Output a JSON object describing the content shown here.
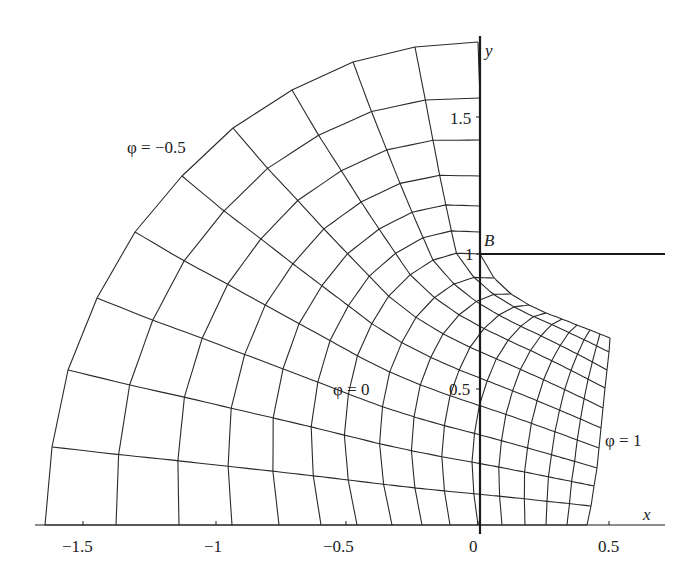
{
  "chart_data": {
    "type": "diagram",
    "title": "",
    "xlabel": "x",
    "ylabel": "y",
    "x_ticks": [
      "−1.5",
      "−1",
      "−0.5",
      "0",
      "0.5"
    ],
    "x_tick_values": [
      -1.5,
      -1,
      -0.5,
      0,
      0.5
    ],
    "y_ticks": [
      "0.5",
      "1",
      "1.5"
    ],
    "y_tick_values": [
      0.5,
      1,
      1.5
    ],
    "xlim": [
      -1.65,
      0.7
    ],
    "ylim": [
      0,
      1.78
    ],
    "point_labels": [
      {
        "text": "B",
        "x": 0,
        "y": 1
      }
    ],
    "curve_labels": [
      {
        "text": "φ = −0.5",
        "position": "outer arc"
      },
      {
        "text": "φ = 0",
        "position": "middle"
      },
      {
        "text": "φ = 1",
        "position": "right boundary"
      }
    ],
    "phi_range": [
      -0.5,
      1.0
    ],
    "phi_step": 0.1,
    "psi_range": [
      0,
      1.0
    ],
    "psi_step": 0.1,
    "grid_on": false,
    "legend": "none"
  },
  "axes": {
    "x_label": "x",
    "y_label": "y",
    "x_ticks": [
      "−1.5",
      "−1",
      "−0.5",
      "0",
      "0.5"
    ],
    "y_ticks": [
      "0.5",
      "1",
      "1.5"
    ],
    "y_tick_1": "1",
    "y_tick_15": "1.5",
    "y_tick_05": "0.5"
  },
  "labels": {
    "point_b": "B",
    "phi_outer": "φ = −0.5",
    "phi_zero": "φ = 0",
    "phi_one": "φ = 1"
  },
  "colors": {
    "line": "#2a2a2a",
    "axis": "#1a1a1a",
    "background": "#ffffff"
  }
}
